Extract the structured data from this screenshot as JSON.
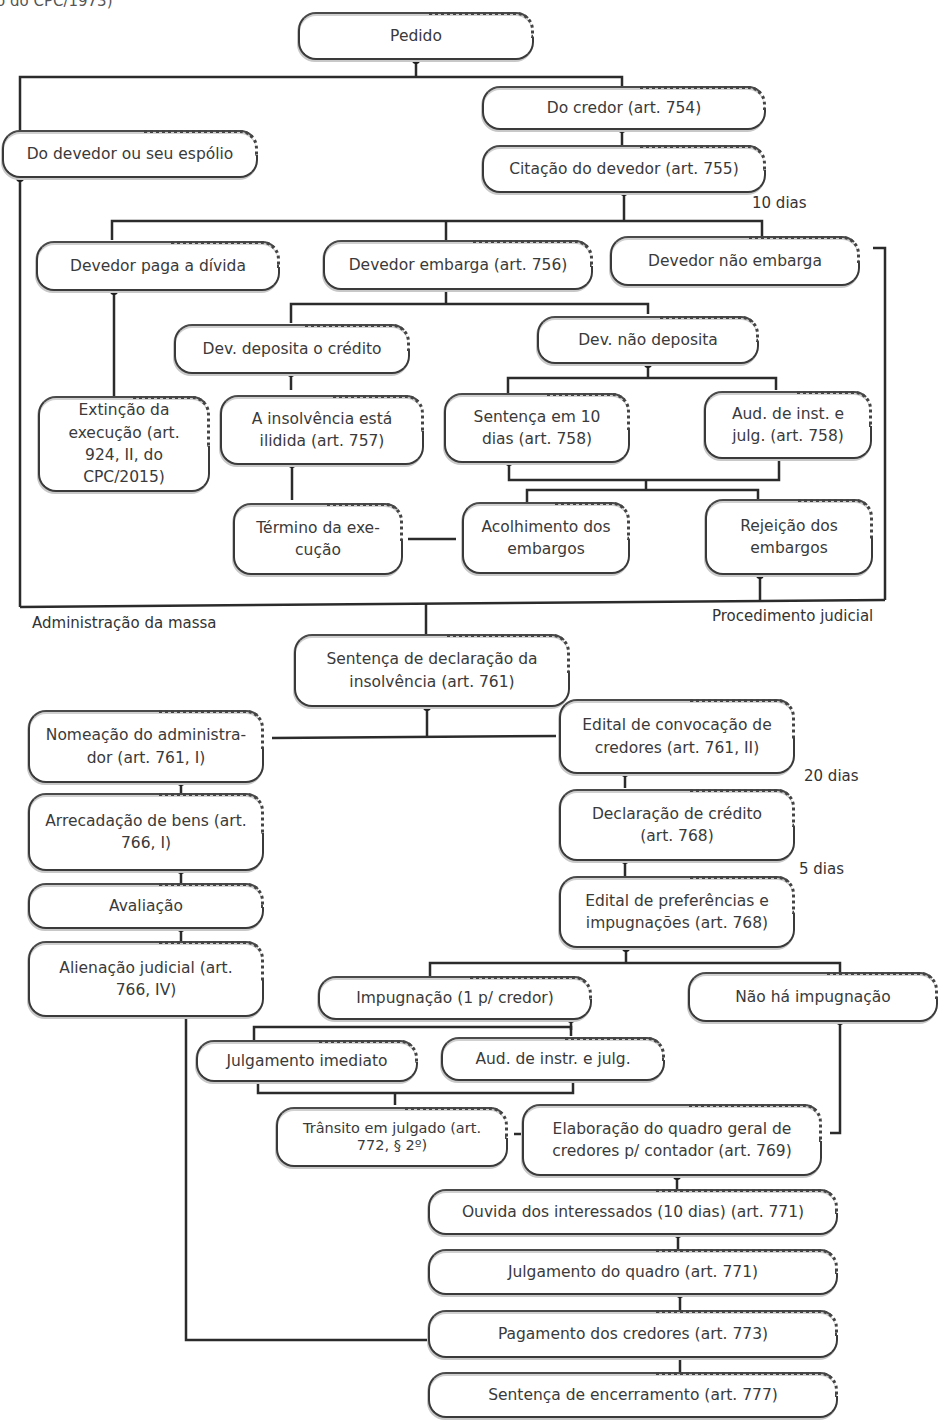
{
  "header_fragment": "o do CPC/1973)",
  "nodes": {
    "pedido": "Pedido",
    "do_devedor": "Do devedor ou seu espólio",
    "do_credor": "Do credor (art. 754)",
    "citacao": "Citação do devedor (art. 755)",
    "devedor_paga": "Devedor paga a dívida",
    "devedor_embarga": "Devedor embarga (art. 756)",
    "devedor_nao_embarga": "Devedor não embarga",
    "dev_deposita": "Dev. deposita o crédito",
    "dev_nao_deposita": "Dev. não deposita",
    "extincao": "Extinção da execução (art. 924, II, do CPC/2015)",
    "insolvencia_ilidida": "A insolvência está ilidida (art. 757)",
    "sentenca_10_dias": "Sentença em 10 dias (art. 758)",
    "aud_inst_julg": "Aud. de inst. e julg. (art. 758)",
    "termino_execucao": "Término da exe-cução",
    "acolhimento": "Acolhimento dos embargos",
    "rejeicao": "Rejeição dos embargos",
    "sentenca_declaracao": "Sentença de declaração da insolvência (art. 761)",
    "nomeacao_admin": "Nomeação do administra-dor (art. 761, I)",
    "edital_convocacao": "Edital de convocação de credores (art. 761, II)",
    "arrecadacao": "Arrecadação de bens (art. 766, I)",
    "declaracao_credito": "Declaração de crédito (art. 768)",
    "avaliacao": "Avaliação",
    "edital_preferencias": "Edital de preferências e impugnações (art. 768)",
    "alienacao": "Alienação judicial (art. 766, IV)",
    "impugnacao": "Impugnação (1 p/ credor)",
    "nao_ha_impugnacao": "Não há impugnação",
    "julgamento_imediato": "Julgamento imediato",
    "aud_instr_julg": "Aud. de instr. e julg.",
    "transito_julgado": "Trânsito em julgado (art. 772, § 2º)",
    "elaboracao_quadro": "Elaboração do quadro geral de credores p/ contador (art. 769)",
    "ouvida": "Ouvida dos interessados (10 dias) (art. 771)",
    "julgamento_quadro": "Julgamento do quadro (art. 771)",
    "pagamento": "Pagamento dos credores (art. 773)",
    "sentenca_encerramento": "Sentença de encerramento (art. 777)"
  },
  "labels": {
    "dias_10": "10 dias",
    "admin_massa": "Administração da massa",
    "proc_judicial": "Procedimento judicial",
    "dias_20": "20 dias",
    "dias_5": "5 dias"
  },
  "colors": {
    "line": "#2b2b2b",
    "text": "#3a3a3a",
    "shadow": "#c8c8c8"
  }
}
